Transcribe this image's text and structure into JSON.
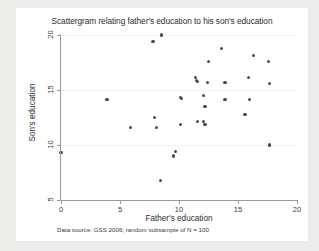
{
  "chart_data": {
    "type": "scatter",
    "title": "Scattergram relating father's education to his son's education",
    "xlabel": "Father's education",
    "ylabel": "Son's education",
    "note": "Data source: GSS 2006; random subsample of N = 100",
    "xlim": [
      0,
      20
    ],
    "ylim": [
      5,
      20
    ],
    "xticks": [
      0,
      5,
      10,
      15,
      20
    ],
    "yticks": [
      5,
      10,
      15,
      20
    ],
    "xtick_labels": [
      "0",
      "5",
      "10",
      "15",
      "20"
    ],
    "ytick_labels": [
      "5",
      "10",
      "15",
      "20"
    ],
    "grid": "horizontal-faint",
    "legend": "none",
    "marker_color": "#4a4a55",
    "points": [
      {
        "x": 0.0,
        "y": 9.3
      },
      {
        "x": 3.9,
        "y": 14.1
      },
      {
        "x": 5.9,
        "y": 11.6
      },
      {
        "x": 7.8,
        "y": 19.4
      },
      {
        "x": 7.9,
        "y": 12.5
      },
      {
        "x": 8.1,
        "y": 11.6
      },
      {
        "x": 8.5,
        "y": 20.0
      },
      {
        "x": 8.4,
        "y": 6.8
      },
      {
        "x": 9.5,
        "y": 9.0
      },
      {
        "x": 9.7,
        "y": 9.4
      },
      {
        "x": 10.1,
        "y": 14.3
      },
      {
        "x": 10.2,
        "y": 14.2
      },
      {
        "x": 10.1,
        "y": 11.9
      },
      {
        "x": 11.4,
        "y": 16.1
      },
      {
        "x": 11.5,
        "y": 15.9
      },
      {
        "x": 11.6,
        "y": 15.8
      },
      {
        "x": 11.6,
        "y": 12.1
      },
      {
        "x": 12.1,
        "y": 12.1
      },
      {
        "x": 12.2,
        "y": 11.9
      },
      {
        "x": 12.2,
        "y": 13.5
      },
      {
        "x": 12.1,
        "y": 14.5
      },
      {
        "x": 12.4,
        "y": 15.7
      },
      {
        "x": 12.5,
        "y": 17.6
      },
      {
        "x": 13.6,
        "y": 18.8
      },
      {
        "x": 13.9,
        "y": 15.7
      },
      {
        "x": 13.9,
        "y": 14.1
      },
      {
        "x": 15.6,
        "y": 12.8
      },
      {
        "x": 15.9,
        "y": 16.1
      },
      {
        "x": 16.0,
        "y": 14.1
      },
      {
        "x": 16.3,
        "y": 18.1
      },
      {
        "x": 17.6,
        "y": 17.6
      },
      {
        "x": 17.7,
        "y": 15.6
      },
      {
        "x": 17.7,
        "y": 10.0
      }
    ]
  }
}
